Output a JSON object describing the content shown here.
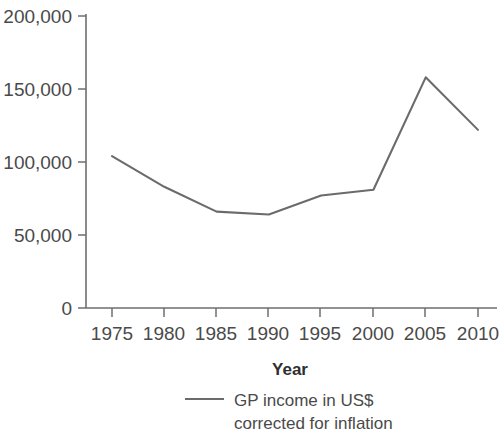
{
  "chart_data": {
    "type": "line",
    "title": "",
    "xlabel": "Year",
    "ylabel": "",
    "x": [
      1975,
      1980,
      1985,
      1990,
      1995,
      2000,
      2005,
      2010
    ],
    "series": [
      {
        "name": "GP income in US$ corrected for inflation",
        "values": [
          104000,
          83000,
          66000,
          64000,
          77000,
          81000,
          158000,
          122000
        ]
      }
    ],
    "xlim": [
      1973,
      2012
    ],
    "ylim": [
      0,
      200000
    ],
    "xticks": [
      1975,
      1980,
      1985,
      1990,
      1995,
      2000,
      2005,
      2010
    ],
    "xtick_labels": [
      "1975",
      "1980",
      "1985",
      "1990",
      "1995",
      "2000",
      "2005",
      "2010"
    ],
    "yticks": [
      0,
      50000,
      100000,
      150000,
      200000
    ],
    "ytick_labels": [
      "0",
      "50,000",
      "100,000",
      "150,000",
      "200,000"
    ],
    "grid": false,
    "legend_position": "bottom-center",
    "line_color": "#6b6b6b",
    "axis_color": "#6e6e6e",
    "text_color": "#4a4a4a"
  },
  "axes": {
    "x_title": "Year",
    "y_tick_0": "0",
    "y_tick_1": "50,000",
    "y_tick_2": "100,000",
    "y_tick_3": "150,000",
    "y_tick_4": "200,000",
    "x_tick_0": "1975",
    "x_tick_1": "1980",
    "x_tick_2": "1985",
    "x_tick_3": "1990",
    "x_tick_4": "1995",
    "x_tick_5": "2000",
    "x_tick_6": "2005",
    "x_tick_7": "2010"
  },
  "legend": {
    "line_1": "GP income in US$",
    "line_2": "corrected for inflation"
  }
}
